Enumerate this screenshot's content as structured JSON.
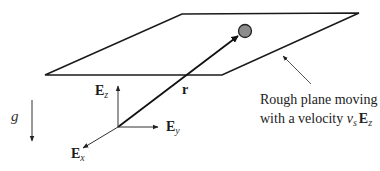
{
  "diagram": {
    "plane_label_line1": "Rough plane moving",
    "plane_label_line2_prefix": "with a velocity ",
    "velocity_symbol": "v",
    "velocity_subscript": "s",
    "velocity_direction": "E",
    "velocity_direction_subscript": "z",
    "position_vector_label": "r",
    "gravity_label": "g",
    "basis": {
      "ez": {
        "symbol": "E",
        "subscript": "z"
      },
      "ey": {
        "symbol": "E",
        "subscript": "y"
      },
      "ex": {
        "symbol": "E",
        "subscript": "x"
      }
    },
    "colors": {
      "line": "#1a1a1a",
      "thin_line": "#333333",
      "particle_fill": "#8c8c8c"
    }
  }
}
